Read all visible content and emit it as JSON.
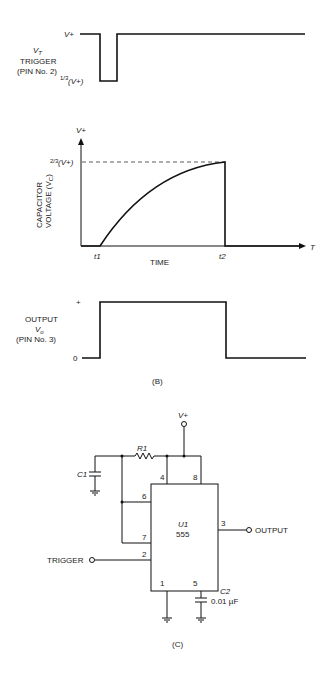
{
  "panel_b": {
    "label": "(B)",
    "trigger": {
      "label_symbol": "V",
      "label_subscript": "T",
      "label_line1": "TRIGGER",
      "label_line2": "(PIN No. 2)",
      "high_level": "V+",
      "low_level_frac": "1/3",
      "low_level_text": "(V+)"
    },
    "capacitor": {
      "ylabel_line1": "CAPACITOR",
      "ylabel_line2": "VOLTAGE (V",
      "ylabel_sub": "C",
      "ylabel_end": ")",
      "y_top": "V+",
      "threshold_frac": "2/3",
      "threshold_text": "(V+)",
      "x_axis_label": "T",
      "t1": "t1",
      "t2": "t2",
      "xlabel": "TIME"
    },
    "output": {
      "label_line1": "OUTPUT",
      "label_symbol": "V",
      "label_subscript": "o",
      "label_line3": "(PIN No. 3)",
      "high_level": "+",
      "low_level": "0"
    }
  },
  "panel_c": {
    "label": "(C)",
    "supply": "V+",
    "resistor": "R1",
    "cap_c1": "C1",
    "ic_name": "U1",
    "ic_part": "555",
    "pins": {
      "p1": "1",
      "p2": "2",
      "p3": "3",
      "p4": "4",
      "p5": "5",
      "p6": "6",
      "p7": "7",
      "p8": "8"
    },
    "cap_c2": "C2",
    "cap_c2_value": "0.01 µF",
    "output_label": "OUTPUT",
    "trigger_label": "TRIGGER"
  }
}
